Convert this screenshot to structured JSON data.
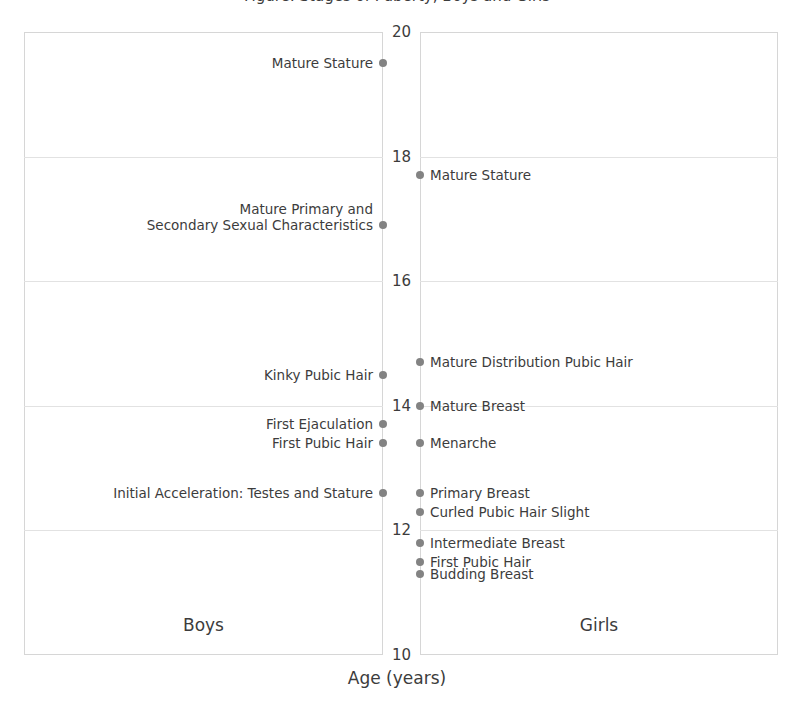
{
  "chart_data": {
    "type": "scatter",
    "title": "",
    "xlabel": "Age (years)",
    "ylabel": "",
    "axis_orientation": "age-vertical",
    "ylim": [
      10,
      20
    ],
    "yticks": [
      10,
      12,
      14,
      16,
      18,
      20
    ],
    "ytick_labels": [
      "10",
      "12",
      "14",
      "16",
      "18",
      "20"
    ],
    "grid": true,
    "legend": "none",
    "panels": [
      {
        "name": "Boys",
        "caption": "Boys",
        "side": "left",
        "series_name": "Boys developmental milestones",
        "points": [
          {
            "label": "Mature Stature",
            "age": 19.5
          },
          {
            "label": "Mature Primary and\nSecondary Sexual Characteristics",
            "age": 16.9
          },
          {
            "label": "Kinky Pubic Hair",
            "age": 14.5
          },
          {
            "label": "First Ejaculation",
            "age": 13.7
          },
          {
            "label": "First Pubic Hair",
            "age": 13.4
          },
          {
            "label": "Initial Acceleration: Testes and Stature",
            "age": 12.6
          }
        ]
      },
      {
        "name": "Girls",
        "caption": "Girls",
        "side": "right",
        "series_name": "Girls developmental milestones",
        "points": [
          {
            "label": "Mature Stature",
            "age": 17.7
          },
          {
            "label": "Mature Distribution Pubic Hair",
            "age": 14.7
          },
          {
            "label": "Mature Breast",
            "age": 14.0
          },
          {
            "label": "Menarche",
            "age": 13.4
          },
          {
            "label": "Primary Breast",
            "age": 12.6
          },
          {
            "label": "Curled Pubic Hair Slight",
            "age": 12.3
          },
          {
            "label": "Intermediate Breast",
            "age": 11.8
          },
          {
            "label": "First Pubic Hair",
            "age": 11.5
          },
          {
            "label": "Budding Breast",
            "age": 11.3
          }
        ]
      }
    ]
  },
  "title_strip": {
    "text": "Figure: Stages of Puberty, Boys and Girls"
  },
  "axis": {
    "x_title": "Age (years)",
    "ticks": [
      "20",
      "18",
      "16",
      "14",
      "12",
      "10"
    ]
  },
  "panels": {
    "boys": {
      "caption": "Boys"
    },
    "girls": {
      "caption": "Girls"
    }
  },
  "events_boys": [
    {
      "label": "Mature Stature"
    },
    {
      "label": "Mature Primary and\nSecondary Sexual Characteristics"
    },
    {
      "label": "Kinky Pubic Hair"
    },
    {
      "label": "First Ejaculation"
    },
    {
      "label": "First Pubic Hair"
    },
    {
      "label": "Initial Acceleration: Testes and Stature"
    }
  ],
  "events_girls": [
    {
      "label": "Mature Stature"
    },
    {
      "label": "Mature Distribution Pubic Hair"
    },
    {
      "label": "Mature Breast"
    },
    {
      "label": "Menarche"
    },
    {
      "label": "Primary Breast"
    },
    {
      "label": "Curled Pubic Hair Slight"
    },
    {
      "label": "Intermediate Breast"
    },
    {
      "label": "First Pubic Hair"
    },
    {
      "label": "Budding Breast"
    }
  ],
  "colors": {
    "marker": "#838383",
    "text": "#3c3c3c",
    "frame": "#d6d6d6",
    "gridline": "#e2e2e2",
    "background": "#ffffff"
  }
}
